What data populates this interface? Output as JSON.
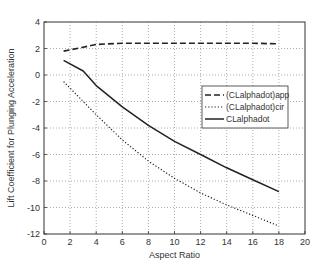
{
  "chart_data": {
    "type": "line",
    "title": "",
    "xlabel": "Aspect Ratio",
    "ylabel": "Lift Coefficient for Plunging Acceleration",
    "xlim": [
      0,
      20
    ],
    "ylim": [
      -12,
      4
    ],
    "xticks": [
      0,
      2,
      4,
      6,
      8,
      10,
      12,
      14,
      16,
      18,
      20
    ],
    "yticks": [
      4,
      2,
      0,
      -2,
      -4,
      -6,
      -8,
      -10,
      -12
    ],
    "grid": true,
    "legend_position": "upper right (inside, below top)",
    "x": [
      1.5,
      3,
      4,
      6,
      8,
      10,
      12,
      14,
      16,
      18
    ],
    "series": [
      {
        "name": "(CLalphadot)app",
        "style": "dashed",
        "values": [
          1.8,
          2.1,
          2.3,
          2.4,
          2.4,
          2.4,
          2.4,
          2.4,
          2.4,
          2.35
        ]
      },
      {
        "name": "(CLalphadot)cir",
        "style": "dotted",
        "values": [
          -0.5,
          -2.0,
          -3.0,
          -4.9,
          -6.5,
          -7.8,
          -8.9,
          -9.8,
          -10.6,
          -11.4
        ]
      },
      {
        "name": "CLalphadot",
        "style": "solid",
        "values": [
          1.1,
          0.3,
          -0.8,
          -2.4,
          -3.8,
          -5.0,
          -6.0,
          -7.0,
          -7.9,
          -8.8
        ]
      }
    ]
  }
}
